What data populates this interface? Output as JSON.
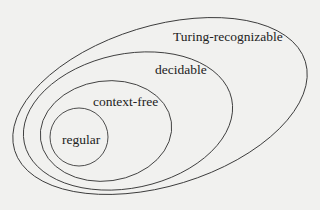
{
  "diagram": {
    "type": "nested-sets",
    "colors": {
      "background": "#f1f1ef",
      "stroke": "#3a3a3a",
      "text": "#222222"
    },
    "sets": [
      {
        "id": "turing",
        "label": "Turing-recognizable",
        "contains": [
          "decidable"
        ]
      },
      {
        "id": "decidable",
        "label": "decidable",
        "contains": [
          "context-free"
        ]
      },
      {
        "id": "context-free",
        "label": "context-free",
        "contains": [
          "regular"
        ]
      },
      {
        "id": "regular",
        "label": "regular",
        "contains": []
      }
    ]
  }
}
